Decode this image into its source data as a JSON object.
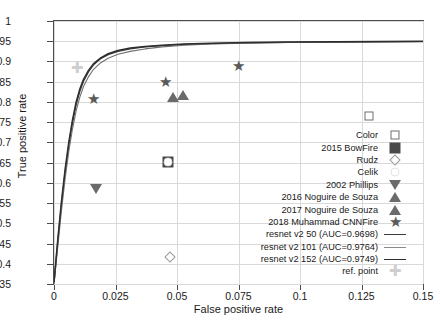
{
  "chart_data": {
    "type": "scatter",
    "title": "",
    "xlabel": "False positive rate",
    "ylabel": "True positive rate",
    "xlim": [
      0,
      0.15
    ],
    "ylim": [
      0.35,
      1
    ],
    "grid": true,
    "legend_position": "right-inside",
    "xticks": [
      "0",
      "0.025",
      "0.05",
      "0.075",
      "0.1",
      "0.125",
      "0.15"
    ],
    "xtick_values": [
      0,
      0.025,
      0.05,
      0.075,
      0.1,
      0.125,
      0.15
    ],
    "yticks": [
      "0.35",
      "0.4",
      "0.45",
      "0.5",
      "0.55",
      "0.6",
      "0.65",
      "0.7",
      "0.75",
      "0.8",
      "0.85",
      "0.9",
      "0.95",
      "1"
    ],
    "ytick_values": [
      0.35,
      0.4,
      0.45,
      0.5,
      0.55,
      0.6,
      0.65,
      0.7,
      0.75,
      0.8,
      0.85,
      0.9,
      0.95,
      1
    ],
    "points": [
      {
        "name": "Color",
        "marker": "square-open",
        "x": 0.128,
        "y": 0.765,
        "color": "#6e6e6e"
      },
      {
        "name": "2015 BowFire",
        "marker": "square-filled",
        "x": 0.0465,
        "y": 0.651,
        "color": "#4a4a4a"
      },
      {
        "name": "Rudz",
        "marker": "diamond-open",
        "x": 0.047,
        "y": 0.416,
        "color": "#9a9a9a"
      },
      {
        "name": "Celik",
        "marker": "circle-open",
        "x": 0.0465,
        "y": 0.651,
        "color": "#e3e3e3"
      },
      {
        "name": "2002 Phillips",
        "marker": "triangle-down",
        "x": 0.0172,
        "y": 0.586,
        "color": "#6b6b6b"
      },
      {
        "name": "2016 Noguire de Souza",
        "marker": "triangle-up",
        "x": 0.0483,
        "y": 0.813,
        "color": "#6b6b6b"
      },
      {
        "name": "2017 Noguire de Souza",
        "marker": "triangle-up",
        "x": 0.0525,
        "y": 0.817,
        "color": "#6b6b6b"
      },
      {
        "name": "2018 Muhammad CNNFire a",
        "marker": "star",
        "x": 0.0162,
        "y": 0.807,
        "color": "#5a5a5a"
      },
      {
        "name": "2018 Muhammad CNNFire b",
        "marker": "star",
        "x": 0.0455,
        "y": 0.849,
        "color": "#5a5a5a"
      },
      {
        "name": "2018 Muhammad CNNFire c",
        "marker": "star",
        "x": 0.0748,
        "y": 0.889,
        "color": "#5a5a5a"
      },
      {
        "name": "ref. point",
        "marker": "cross",
        "x": 0.0095,
        "y": 0.884,
        "color": "#cfcfcf"
      }
    ],
    "series": [
      {
        "name": "resnet v2 50 (AUC=0.9698)",
        "auc": 0.9698,
        "color": "#3d3d3d",
        "width": 1.3,
        "x": [
          0.0,
          0.0015,
          0.003,
          0.0045,
          0.006,
          0.0075,
          0.009,
          0.0105,
          0.012,
          0.014,
          0.016,
          0.019,
          0.022,
          0.026,
          0.031,
          0.037,
          0.044,
          0.053,
          0.064,
          0.078,
          0.095,
          0.115,
          0.132,
          0.15
        ],
        "y": [
          0.352,
          0.452,
          0.545,
          0.625,
          0.693,
          0.748,
          0.793,
          0.826,
          0.851,
          0.874,
          0.891,
          0.907,
          0.917,
          0.925,
          0.931,
          0.936,
          0.939,
          0.942,
          0.944,
          0.946,
          0.947,
          0.948,
          0.9485,
          0.949
        ]
      },
      {
        "name": "resnet v2 101 (AUC=0.9764)",
        "auc": 0.9764,
        "color": "#707070",
        "width": 1.1,
        "x": [
          0.0,
          0.0015,
          0.003,
          0.0045,
          0.006,
          0.0075,
          0.009,
          0.0105,
          0.012,
          0.014,
          0.016,
          0.019,
          0.022,
          0.026,
          0.031,
          0.037,
          0.044,
          0.053,
          0.064,
          0.078,
          0.095,
          0.115,
          0.132,
          0.15
        ],
        "y": [
          0.349,
          0.44,
          0.53,
          0.609,
          0.677,
          0.733,
          0.778,
          0.812,
          0.838,
          0.862,
          0.88,
          0.897,
          0.908,
          0.918,
          0.925,
          0.931,
          0.936,
          0.94,
          0.943,
          0.945,
          0.947,
          0.9485,
          0.949,
          0.9495
        ]
      },
      {
        "name": "resnet v2 152 (AUC=0.9749)",
        "auc": 0.9749,
        "color": "#2e2e2e",
        "width": 1.5,
        "x": [
          0.0,
          0.0015,
          0.003,
          0.0045,
          0.006,
          0.0075,
          0.009,
          0.0105,
          0.012,
          0.014,
          0.016,
          0.019,
          0.022,
          0.026,
          0.031,
          0.037,
          0.044,
          0.053,
          0.064,
          0.078,
          0.095,
          0.115,
          0.132,
          0.15
        ],
        "y": [
          0.355,
          0.458,
          0.552,
          0.633,
          0.7,
          0.755,
          0.8,
          0.832,
          0.856,
          0.878,
          0.894,
          0.909,
          0.919,
          0.927,
          0.933,
          0.937,
          0.94,
          0.943,
          0.945,
          0.947,
          0.948,
          0.949,
          0.9495,
          0.95
        ]
      }
    ],
    "legend_entries": [
      {
        "label": "Color",
        "symbol": "square-open"
      },
      {
        "label": "2015 BowFire",
        "symbol": "square-filled"
      },
      {
        "label": "Rudz",
        "symbol": "diamond-open"
      },
      {
        "label": "Celik",
        "symbol": "circle-open"
      },
      {
        "label": "2002 Phillips",
        "symbol": "triangle-down"
      },
      {
        "label": "2016 Noguire de Souza",
        "symbol": "triangle-up"
      },
      {
        "label": "2017 Noguire de Souza",
        "symbol": "triangle-up"
      },
      {
        "label": "2018 Muhammad CNNFire",
        "symbol": "star"
      },
      {
        "label": "resnet v2 50 (AUC=0.9698)",
        "symbol": "line",
        "color": "#3d3d3d",
        "width": 1.3
      },
      {
        "label": "resnet v2 101 (AUC=0.9764)",
        "symbol": "line",
        "color": "#8a8a8a",
        "width": 1.0
      },
      {
        "label": "resnet v2 152 (AUC=0.9749)",
        "symbol": "line",
        "color": "#2e2e2e",
        "width": 1.6
      },
      {
        "label": "ref. point",
        "symbol": "cross"
      }
    ]
  }
}
